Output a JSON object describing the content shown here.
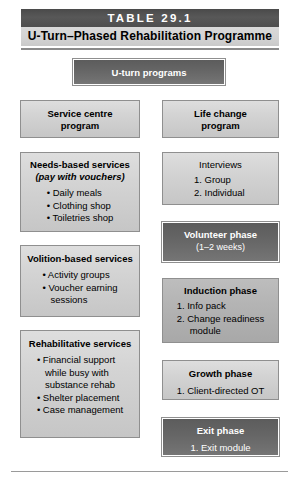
{
  "table": {
    "number_label": "TABLE 29.1",
    "title": "U-Turn–Phased Rehabilitation Programme"
  },
  "diagram": {
    "type": "flow-diagram",
    "root": {
      "label": "U-turn programs"
    },
    "left_column": [
      {
        "title": "Service centre",
        "line2": "program",
        "items": []
      },
      {
        "title": "Needs-based services",
        "subtitle": "(pay with vouchers)",
        "items": [
          "Daily meals",
          "Clothing shop",
          "Toiletries shop"
        ]
      },
      {
        "title": "Volition-based services",
        "items": [
          "Activity groups",
          "Voucher earning\nsessions"
        ]
      },
      {
        "title": "Rehabilitative services",
        "items": [
          "Financial support\nwhile busy with\nsubstance rehab",
          "Shelter placement",
          "Case management"
        ]
      }
    ],
    "right_column": [
      {
        "title": "Life change",
        "line2": "program",
        "items": []
      },
      {
        "title": "Interviews",
        "items": [
          "Group",
          "Individual"
        ]
      },
      {
        "title": "Volunteer phase",
        "note": "(1–2 weeks)",
        "items": []
      },
      {
        "title": "Induction phase",
        "items": [
          "Info pack",
          "Change readiness\nmodule"
        ]
      },
      {
        "title": "Growth phase",
        "items": [
          "Client-directed OT"
        ]
      },
      {
        "title": "Exit phase",
        "items": [
          "Exit module"
        ]
      }
    ]
  },
  "colors": {
    "header_dark": "#585858",
    "header_light": "#d4d4d4",
    "box_light": "#d4d4d4",
    "box_mid": "#b4b4b4",
    "box_dark": "#666666",
    "border": "#8f8f8f",
    "text": "#000000",
    "text_inverse": "#ffffff"
  }
}
